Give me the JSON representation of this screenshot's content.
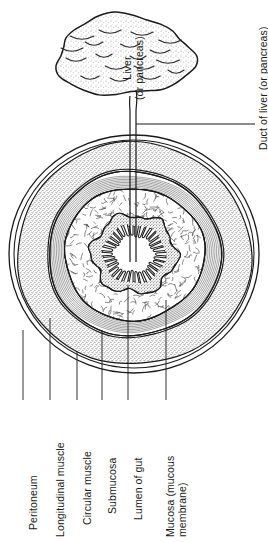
{
  "figure": {
    "orientation": "labels rotated 90 degrees counter-clockwise",
    "colors": {
      "ink": "#1a1a1a",
      "stipple_fill": "#d8d8d8",
      "background": "#ffffff",
      "hatch": "#555555"
    }
  },
  "organ": {
    "name": "liver-or-pancreas",
    "label_line1": "Liver",
    "label_line2": "(or pancreas)"
  },
  "duct": {
    "name": "duct-of-liver-or-pancreas",
    "label": "Duct of liver (or pancreas)"
  },
  "gut": {
    "name": "gut-cross-section",
    "layers": [
      {
        "id": "peritoneum",
        "label": "Peritoneum",
        "texture": "thin-double-line"
      },
      {
        "id": "longitudinal-muscle",
        "label": "Longitudinal muscle",
        "texture": "stipple"
      },
      {
        "id": "circular-muscle",
        "label": "Circular muscle",
        "texture": "concentric-hatch"
      },
      {
        "id": "submucosa",
        "label": "Submucosa",
        "texture": "squiggle"
      },
      {
        "id": "lumen-of-gut",
        "label": "Lumen of gut",
        "texture": "blank"
      },
      {
        "id": "mucosa",
        "label": "Mucosa (mucous membrane)",
        "texture": "villi",
        "label_line1": "Mucosa (mucous",
        "label_line2": "membrane)"
      }
    ]
  }
}
